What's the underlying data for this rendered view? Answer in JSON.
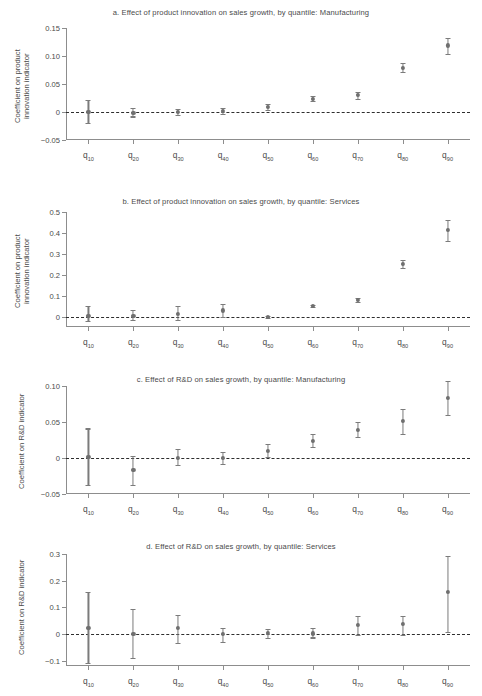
{
  "figure": {
    "quantile_labels": [
      "q10",
      "q20",
      "q30",
      "q40",
      "q50",
      "q60",
      "q70",
      "q80",
      "q90"
    ],
    "quantile_prefix": "q",
    "quantile_subs": [
      "10",
      "20",
      "30",
      "40",
      "50",
      "60",
      "70",
      "80",
      "90"
    ]
  },
  "chart_data": [
    {
      "type": "scatter",
      "panel": "a",
      "title": "a. Effect of product innovation on sales growth, by quantile: Manufacturing",
      "xlabel": "",
      "ylabel": "Coefficient on product\ninnovation indicator",
      "categories": [
        "q10",
        "q20",
        "q30",
        "q40",
        "q50",
        "q60",
        "q70",
        "q80",
        "q90"
      ],
      "values": [
        0.0,
        -0.001,
        0.0,
        0.002,
        0.009,
        0.024,
        0.03,
        0.079,
        0.119
      ],
      "ci_low": [
        -0.02,
        -0.008,
        -0.006,
        -0.004,
        0.004,
        0.019,
        0.024,
        0.071,
        0.104
      ],
      "ci_high": [
        0.021,
        0.007,
        0.006,
        0.008,
        0.015,
        0.029,
        0.036,
        0.087,
        0.133
      ],
      "yticks": [
        -0.05,
        0,
        0.05,
        0.1,
        0.15
      ],
      "ytick_labels": [
        "−0.05",
        "0",
        "0.05",
        "0.10",
        "0.15"
      ],
      "ylim": [
        -0.05,
        0.15
      ],
      "grid": false,
      "zero_reference_line": true,
      "legend": "none"
    },
    {
      "type": "scatter",
      "panel": "b",
      "title": "b. Effect of product innovation on sales growth, by quantile: Services",
      "xlabel": "",
      "ylabel": "Coefficient on product\ninnovation indicator",
      "categories": [
        "q10",
        "q20",
        "q30",
        "q40",
        "q50",
        "q60",
        "q70",
        "q80",
        "q90"
      ],
      "values": [
        0.003,
        0.003,
        0.013,
        0.029,
        -0.002,
        0.049,
        0.08,
        0.253,
        0.413
      ],
      "ci_low": [
        -0.023,
        -0.018,
        -0.018,
        -0.003,
        -0.006,
        0.044,
        0.071,
        0.232,
        0.362
      ],
      "ci_high": [
        0.05,
        0.031,
        0.049,
        0.062,
        0.003,
        0.055,
        0.09,
        0.272,
        0.462
      ],
      "yticks": [
        0,
        0.1,
        0.2,
        0.3,
        0.4,
        0.5
      ],
      "ytick_labels": [
        "0",
        "0.1",
        "0.2",
        "0.3",
        "0.4",
        "0.5"
      ],
      "ylim": [
        -0.05,
        0.5
      ],
      "grid": false,
      "zero_reference_line": true,
      "legend": "none"
    },
    {
      "type": "scatter",
      "panel": "c",
      "title": "c. Effect of R&D on sales growth, by quantile: Manufacturing",
      "xlabel": "",
      "ylabel": "Coefficient on R&D indicator",
      "categories": [
        "q10",
        "q20",
        "q30",
        "q40",
        "q50",
        "q60",
        "q70",
        "q80",
        "q90"
      ],
      "values": [
        0.002,
        -0.016,
        0.0,
        0.0,
        0.01,
        0.024,
        0.039,
        0.051,
        0.084
      ],
      "ci_low": [
        -0.037,
        -0.037,
        -0.01,
        -0.008,
        0.001,
        0.015,
        0.029,
        0.034,
        0.06
      ],
      "ci_high": [
        0.041,
        0.003,
        0.013,
        0.009,
        0.019,
        0.033,
        0.05,
        0.068,
        0.107
      ],
      "yticks": [
        -0.05,
        0,
        0.05,
        0.1
      ],
      "ytick_labels": [
        "−0.05",
        "0",
        "0.05",
        "0.10"
      ],
      "ylim": [
        -0.05,
        0.1
      ],
      "grid": false,
      "zero_reference_line": true,
      "legend": "none"
    },
    {
      "type": "scatter",
      "panel": "d",
      "title": "d. Effect of R&D on sales growth, by quantile: Services",
      "xlabel": "",
      "ylabel": "Coefficient on R&D indicator",
      "categories": [
        "q10",
        "q20",
        "q30",
        "q40",
        "q50",
        "q60",
        "q70",
        "q80",
        "q90"
      ],
      "values": [
        0.023,
        0.001,
        0.023,
        -0.001,
        0.004,
        0.002,
        0.035,
        0.037,
        0.157
      ],
      "ci_low": [
        -0.11,
        -0.091,
        -0.034,
        -0.03,
        -0.014,
        -0.013,
        -0.003,
        -0.005,
        0.009
      ],
      "ci_high": [
        0.158,
        0.093,
        0.073,
        0.024,
        0.02,
        0.021,
        0.068,
        0.066,
        0.291
      ],
      "yticks": [
        -0.1,
        0,
        0.1,
        0.2,
        0.3
      ],
      "ytick_labels": [
        "−0.1",
        "0",
        "0.1",
        "0.2",
        "0.3"
      ],
      "ylim": [
        -0.12,
        0.3
      ],
      "grid": false,
      "zero_reference_line": true,
      "legend": "none"
    }
  ]
}
